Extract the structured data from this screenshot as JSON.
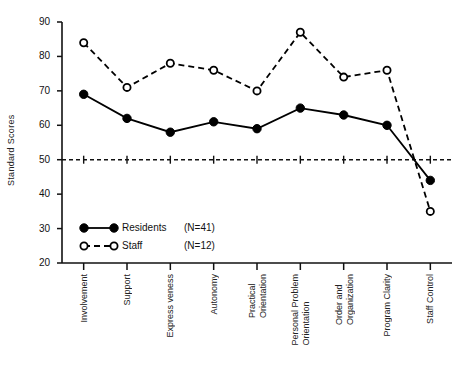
{
  "chart_data": {
    "type": "line",
    "title": "",
    "xlabel": "",
    "ylabel": "Standard Scores",
    "ylim": [
      20,
      90
    ],
    "yticks": [
      20,
      30,
      40,
      50,
      60,
      70,
      80,
      90
    ],
    "grid": false,
    "legend_position": "inside-lower-left",
    "reference_line": {
      "value": 50,
      "style": "dashed"
    },
    "categories": [
      "Involvement",
      "Support",
      "Express veness",
      "Autonomy",
      "Practical Orientation",
      "Personal Problem Orientation",
      "Order and Organization",
      "Program Clarity",
      "Staff Control"
    ],
    "category_lines": [
      [
        "Involvement"
      ],
      [
        "Support"
      ],
      [
        "Express veness"
      ],
      [
        "Autonomy"
      ],
      [
        "Practical",
        "Orientation"
      ],
      [
        "Personal Problem",
        "Orientation"
      ],
      [
        "Order and",
        "Organization"
      ],
      [
        "Program Clarity"
      ],
      [
        "Staff Control"
      ]
    ],
    "series": [
      {
        "name": "Residents",
        "label": "Residents",
        "n_label": "(N=41)",
        "marker": "filled-circle",
        "line": "solid",
        "color": "#000000",
        "values": [
          69,
          62,
          58,
          61,
          59,
          65,
          63,
          60,
          44
        ]
      },
      {
        "name": "Staff",
        "label": "Staff",
        "n_label": "(N=12)",
        "marker": "open-circle",
        "line": "dashed",
        "color": "#000000",
        "values": [
          84,
          71,
          78,
          76,
          70,
          87,
          74,
          76,
          35
        ]
      }
    ]
  },
  "axis": {
    "ytick_labels": [
      "90",
      "80",
      "70",
      "60",
      "50",
      "40",
      "30",
      "20"
    ]
  },
  "legend": {
    "items": [
      {
        "label": "Residents",
        "n": "(N=41)",
        "marker": "filled-circle",
        "line": "solid"
      },
      {
        "label": "Staff",
        "n": "(N=12)",
        "marker": "open-circle",
        "line": "dashed"
      }
    ]
  }
}
